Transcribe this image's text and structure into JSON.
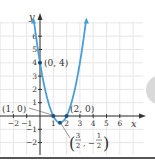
{
  "chart_data": {
    "type": "line",
    "title": "",
    "xlabel": "x",
    "ylabel": "y",
    "function": "y = 2x^2 - 6x + 4",
    "xlim": [
      -2.5,
      7.5
    ],
    "ylim": [
      -2.8,
      7.2
    ],
    "grid": true,
    "x_ticks": [
      -2,
      -1,
      1,
      2,
      3,
      4,
      5,
      6
    ],
    "y_ticks": [
      -2,
      -1,
      1,
      2,
      3,
      4,
      5,
      6
    ],
    "curve_color": "#4a9fd4",
    "points": [
      {
        "x": 0,
        "y": 4,
        "label": "(0, 4)"
      },
      {
        "x": 1,
        "y": 0,
        "label": "(1, 0)"
      },
      {
        "x": 2,
        "y": 0,
        "label": "(2, 0)"
      },
      {
        "x": 1.5,
        "y": -0.5,
        "label": "(3/2, -1/2)"
      }
    ],
    "annotations": [
      "(0, 4)",
      "(1, 0)",
      "(2, 0)",
      "(3/2, -1/2)"
    ]
  },
  "labels": {
    "y_axis": "y",
    "x_axis": "x",
    "p04": "(0, 4)",
    "p10": "(1, 0)",
    "p20": "(2, 0)",
    "vertex_num1": "3",
    "vertex_den1": "2",
    "vertex_num2": "1",
    "vertex_den2": "2"
  }
}
